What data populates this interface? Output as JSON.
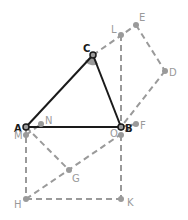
{
  "diagram": {
    "colors": {
      "solid": "#1a1a1a",
      "dashed": "#9a9a9a",
      "label_dark": "#1a1a1a",
      "label_light": "#9a9a9a",
      "angle_fill": "#9a9a9a"
    },
    "points": {
      "A": {
        "label": "A",
        "x": 26,
        "y": 127
      },
      "B": {
        "label": "B",
        "x": 121,
        "y": 127
      },
      "C": {
        "label": "C",
        "x": 93,
        "y": 55
      },
      "L": {
        "label": "L",
        "x": 121,
        "y": 35
      },
      "E": {
        "label": "E",
        "x": 136,
        "y": 25
      },
      "D": {
        "label": "D",
        "x": 165,
        "y": 71
      },
      "F": {
        "label": "F",
        "x": 136,
        "y": 124
      },
      "O": {
        "label": "O",
        "x": 121,
        "y": 135
      },
      "N": {
        "label": "N",
        "x": 41,
        "y": 124
      },
      "M": {
        "label": "M",
        "x": 26,
        "y": 135
      },
      "G": {
        "label": "G",
        "x": 69,
        "y": 170
      },
      "H": {
        "label": "H",
        "x": 26,
        "y": 199
      },
      "K": {
        "label": "K",
        "x": 121,
        "y": 199
      }
    }
  }
}
